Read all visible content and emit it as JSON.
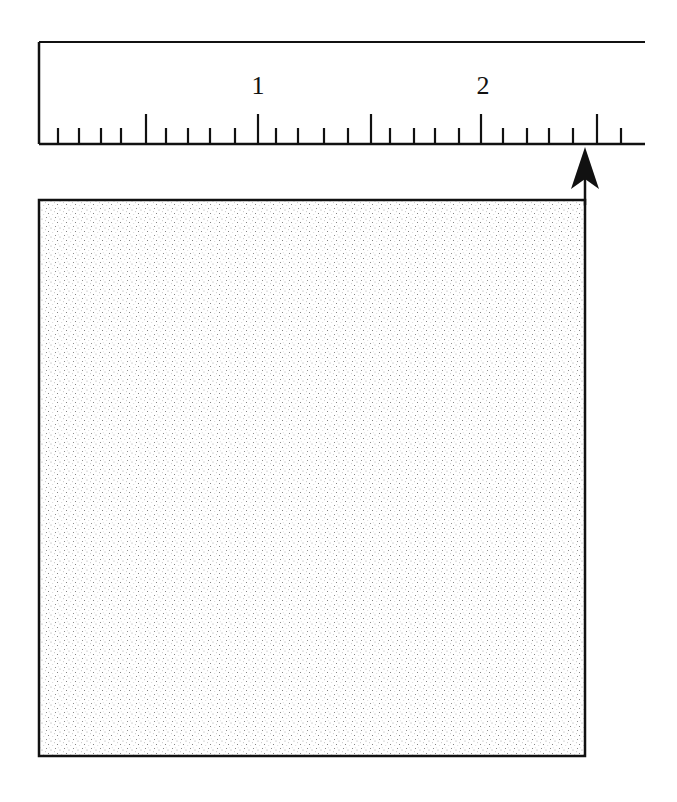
{
  "figure": {
    "ruler": {
      "labels": [
        {
          "text": "1",
          "x": 258
        },
        {
          "text": "2",
          "x": 483
        }
      ],
      "major_ticks_x": [
        146,
        258,
        371,
        481,
        597
      ],
      "minor_ticks_x": [
        58,
        79,
        101,
        121,
        166,
        188,
        210,
        235,
        276,
        298,
        324,
        348,
        390,
        414,
        435,
        459,
        503,
        527,
        549,
        573,
        621
      ],
      "top_y": 42,
      "baseline_y": 144,
      "left_x": 39,
      "right_x": 645
    },
    "arrow": {
      "x": 585,
      "tip_y": 147,
      "base_y": 205,
      "semantic": "measurement-pointer"
    },
    "square": {
      "x": 39,
      "y": 200,
      "width": 546,
      "height": 556,
      "fill": "stippled"
    },
    "measured_value": "about 2.6 units"
  },
  "colors": {
    "ink": "#111111",
    "stipple": "#8a8a8a",
    "background": "#ffffff"
  }
}
